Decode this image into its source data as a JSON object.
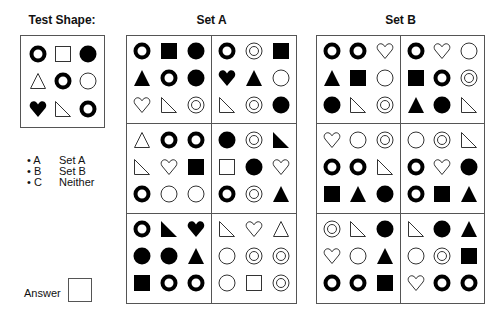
{
  "test_shape": {
    "title": "Test Shape:",
    "shapes": [
      "ring",
      "square-outline",
      "disc",
      "triangle-outline",
      "ring",
      "circle-outline",
      "heart-filled",
      "right-triangle-outline",
      "ring"
    ]
  },
  "set_a": {
    "title": "Set A",
    "panels": [
      [
        "ring",
        "square-filled",
        "disc",
        "triangle-filled",
        "ring",
        "disc",
        "heart-outline",
        "right-triangle-outline",
        "double-circle"
      ],
      [
        "ring",
        "double-circle",
        "square-filled",
        "heart-filled",
        "triangle-filled",
        "circle-outline",
        "right-triangle-outline",
        "double-circle",
        "disc"
      ],
      [
        "triangle-outline",
        "ring",
        "ring",
        "right-triangle-outline",
        "heart-outline",
        "square-filled",
        "ring",
        "circle-outline",
        "circle-outline"
      ],
      [
        "disc",
        "double-circle",
        "right-triangle-filled",
        "square-outline",
        "disc",
        "heart-outline",
        "ring",
        "double-circle",
        "triangle-filled"
      ],
      [
        "ring",
        "right-triangle-filled",
        "heart-filled",
        "disc",
        "disc",
        "triangle-filled",
        "square-filled",
        "ring",
        "ring"
      ],
      [
        "right-triangle-outline",
        "heart-outline",
        "triangle-outline",
        "circle-outline",
        "double-circle",
        "double-circle",
        "circle-outline",
        "square-outline",
        "double-circle"
      ]
    ]
  },
  "set_b": {
    "title": "Set B",
    "panels": [
      [
        "ring",
        "ring",
        "heart-outline",
        "triangle-filled",
        "square-filled",
        "circle-outline",
        "disc",
        "right-triangle-outline",
        "double-circle"
      ],
      [
        "ring",
        "heart-outline",
        "circle-outline",
        "square-filled",
        "ring",
        "double-circle",
        "triangle-filled",
        "disc",
        "right-triangle-outline"
      ],
      [
        "heart-outline",
        "circle-outline",
        "double-circle",
        "ring",
        "ring",
        "right-triangle-outline",
        "square-filled",
        "triangle-filled",
        "disc"
      ],
      [
        "circle-outline",
        "double-circle",
        "right-triangle-outline",
        "ring",
        "heart-outline",
        "disc",
        "ring",
        "square-filled",
        "triangle-filled"
      ],
      [
        "double-circle",
        "right-triangle-outline",
        "disc",
        "heart-outline",
        "circle-outline",
        "triangle-filled",
        "ring",
        "ring",
        "square-filled"
      ],
      [
        "right-triangle-outline",
        "disc",
        "triangle-filled",
        "circle-outline",
        "double-circle",
        "square-filled",
        "heart-outline",
        "ring",
        "ring"
      ]
    ]
  },
  "legend": [
    {
      "key": "• A",
      "label": "Set A"
    },
    {
      "key": "• B",
      "label": "Set B"
    },
    {
      "key": "• C",
      "label": "Neither"
    }
  ],
  "answer": {
    "label": "Answer",
    "value": ""
  }
}
